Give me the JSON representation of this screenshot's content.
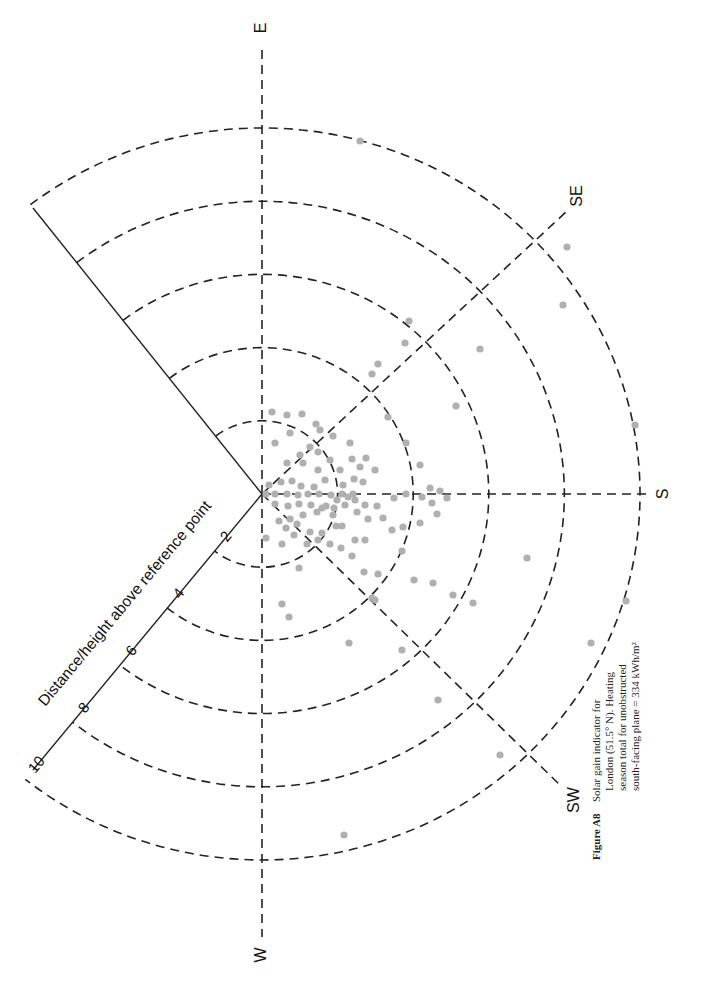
{
  "chart_data": {
    "type": "scatter",
    "subtype": "polar sun-path / solar gain indicator (rotated 90° CCW on page)",
    "caption": {
      "figure_label": "Figure A8",
      "lines": [
        "Solar gain indicator for",
        "London (51.5° N). Heating",
        "season total for unobstructed",
        "south-facing plane = 334 kWh/m²"
      ]
    },
    "radial_axis": {
      "label": "Distance/height above reference point",
      "ticks": [
        2,
        4,
        6,
        8,
        10
      ],
      "range": [
        0,
        10
      ]
    },
    "directions": [
      "E",
      "SE",
      "S",
      "SW",
      "W"
    ],
    "grid": {
      "rings": [
        2,
        4,
        6,
        8,
        10
      ],
      "spokes": [
        "E",
        "SE",
        "S",
        "SW",
        "W"
      ],
      "style": "dashed"
    },
    "points_note": "Each grey dot represents an equal share of heating-season solar gain; positions given as page pixel coordinates (cx, cy) with origin at chart center (262,494).",
    "points": [
      [
        360,
        141
      ],
      [
        567,
        247
      ],
      [
        563,
        305
      ],
      [
        480,
        349
      ],
      [
        409,
        321
      ],
      [
        405,
        343
      ],
      [
        378,
        364
      ],
      [
        456,
        406
      ],
      [
        372,
        374
      ],
      [
        388,
        417
      ],
      [
        635,
        425
      ],
      [
        406,
        443
      ],
      [
        420,
        465
      ],
      [
        440,
        491
      ],
      [
        430,
        488
      ],
      [
        375,
        470
      ],
      [
        363,
        482
      ],
      [
        350,
        443
      ],
      [
        333,
        436
      ],
      [
        316,
        424
      ],
      [
        302,
        414
      ],
      [
        287,
        415
      ],
      [
        272,
        412
      ],
      [
        290,
        433
      ],
      [
        275,
        443
      ],
      [
        287,
        463
      ],
      [
        300,
        455
      ],
      [
        318,
        452
      ],
      [
        330,
        460
      ],
      [
        340,
        470
      ],
      [
        354,
        479
      ],
      [
        360,
        467
      ],
      [
        366,
        458
      ],
      [
        352,
        459
      ],
      [
        343,
        485
      ],
      [
        337,
        500
      ],
      [
        348,
        497
      ],
      [
        355,
        500
      ],
      [
        320,
        430
      ],
      [
        310,
        447
      ],
      [
        303,
        463
      ],
      [
        318,
        470
      ],
      [
        325,
        480
      ],
      [
        314,
        487
      ],
      [
        301,
        486
      ],
      [
        292,
        481
      ],
      [
        281,
        482
      ],
      [
        269,
        485
      ],
      [
        266,
        494
      ],
      [
        275,
        494
      ],
      [
        287,
        494
      ],
      [
        298,
        495
      ],
      [
        308,
        494
      ],
      [
        319,
        494
      ],
      [
        331,
        495
      ],
      [
        342,
        494
      ],
      [
        353,
        494
      ],
      [
        365,
        505
      ],
      [
        377,
        506
      ],
      [
        394,
        498
      ],
      [
        406,
        494
      ],
      [
        422,
        497
      ],
      [
        432,
        503
      ],
      [
        275,
        504
      ],
      [
        288,
        506
      ],
      [
        299,
        504
      ],
      [
        311,
        505
      ],
      [
        322,
        508
      ],
      [
        334,
        508
      ],
      [
        345,
        505
      ],
      [
        357,
        512
      ],
      [
        368,
        519
      ],
      [
        383,
        518
      ],
      [
        392,
        530
      ],
      [
        403,
        527
      ],
      [
        420,
        523
      ],
      [
        437,
        514
      ],
      [
        447,
        498
      ],
      [
        279,
        521
      ],
      [
        290,
        519
      ],
      [
        303,
        515
      ],
      [
        317,
        512
      ],
      [
        326,
        506
      ],
      [
        333,
        515
      ],
      [
        342,
        526
      ],
      [
        355,
        540
      ],
      [
        365,
        540
      ],
      [
        336,
        526
      ],
      [
        322,
        533
      ],
      [
        310,
        532
      ],
      [
        297,
        524
      ],
      [
        286,
        528
      ],
      [
        282,
        544
      ],
      [
        294,
        535
      ],
      [
        307,
        544
      ],
      [
        318,
        540
      ],
      [
        330,
        544
      ],
      [
        341,
        548
      ],
      [
        352,
        556
      ],
      [
        364,
        572
      ],
      [
        378,
        574
      ],
      [
        402,
        551
      ],
      [
        414,
        580
      ],
      [
        433,
        583
      ],
      [
        453,
        595
      ],
      [
        473,
        603
      ],
      [
        375,
        600
      ],
      [
        372,
        598
      ],
      [
        266,
        538
      ],
      [
        299,
        568
      ],
      [
        282,
        604
      ],
      [
        289,
        617
      ],
      [
        349,
        643
      ],
      [
        402,
        650
      ],
      [
        438,
        700
      ],
      [
        527,
        558
      ],
      [
        626,
        601
      ],
      [
        591,
        643
      ],
      [
        500,
        755
      ],
      [
        344,
        835
      ]
    ]
  }
}
